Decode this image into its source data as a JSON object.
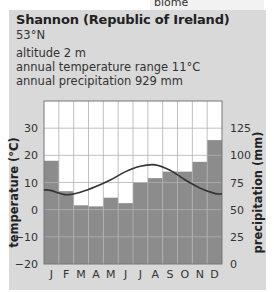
{
  "header": {
    "biome_label": "biome",
    "station": "Shannon (Republic of Ireland)",
    "latitude": "53°N",
    "altitude": "altitude 2 m",
    "temperature_range": "annual temperature range 11°C",
    "annual_precipitation": "annual precipitation 929 mm"
  },
  "colors": {
    "panel": "#d9d9d9",
    "bar": "#8c8c8c",
    "plot_bg": "#ffffff",
    "curve": "#333333",
    "grid": "#b0b0b0"
  },
  "chart_data": {
    "type": "bar",
    "title": "Shannon (Republic of Ireland)",
    "categories": [
      "J",
      "F",
      "M",
      "A",
      "M",
      "J",
      "J",
      "A",
      "S",
      "O",
      "N",
      "D"
    ],
    "series": [
      {
        "name": "precipitation (mm)",
        "type": "bar",
        "axis": "right",
        "values": [
          95,
          67,
          54,
          53,
          61,
          56,
          75,
          79,
          85,
          85,
          94,
          114
        ]
      },
      {
        "name": "temperature (°C)",
        "type": "line",
        "axis": "left",
        "values": [
          7,
          5.5,
          6.5,
          8.5,
          11,
          14,
          16,
          16.5,
          14.5,
          11,
          8,
          6
        ]
      }
    ],
    "ylabel": "temperature (°C)",
    "y2label": "precipitation (mm)",
    "ylim": [
      -20,
      40
    ],
    "y2lim": [
      0,
      150
    ],
    "yticks": [
      -20,
      -10,
      0,
      10,
      20,
      30
    ],
    "y2ticks": [
      0,
      25,
      50,
      75,
      100,
      125
    ],
    "grid": true
  }
}
